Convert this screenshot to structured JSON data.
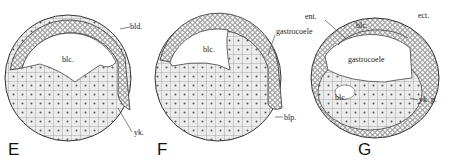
{
  "figure": {
    "panels": [
      {
        "id": "E",
        "letter": "E",
        "labels": {
          "blastocoel": "blc.",
          "blastoderm": "bld.",
          "yolk": "yk."
        }
      },
      {
        "id": "F",
        "letter": "F",
        "labels": {
          "blastocoel": "blc.",
          "gastrocoele": "gastrocoele",
          "blastopore": "blp."
        }
      },
      {
        "id": "G",
        "letter": "G",
        "labels": {
          "entoderm": "ent.",
          "ectoderm": "ect.",
          "blastocoel_top": "blc.",
          "gastrocoele": "gastrocoele",
          "blastocoel_bottom": "blc.",
          "yolk_plug": "yk. p."
        }
      }
    ],
    "colors": {
      "ink": "#222222",
      "cell_fill": "#e8e8e8",
      "background": "#ffffff"
    }
  }
}
